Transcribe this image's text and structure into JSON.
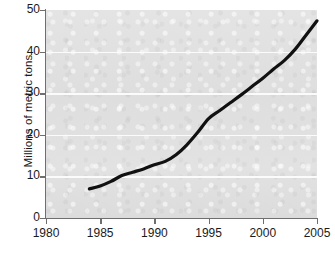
{
  "chart_data": {
    "type": "line",
    "title": "",
    "subtitle": "",
    "xlabel": "",
    "ylabel": "Millions of metric tons",
    "xlim": [
      1980,
      2005
    ],
    "ylim": [
      0,
      50
    ],
    "xticks": [
      1980,
      1985,
      1990,
      1995,
      2000,
      2005
    ],
    "xtick_labels": [
      "1980",
      "1985",
      "1990",
      "1995",
      "2000",
      "2005"
    ],
    "yticks": [
      0,
      10,
      20,
      30,
      40,
      50
    ],
    "ytick_labels": [
      "0",
      "10",
      "20",
      "30",
      "40",
      "50"
    ],
    "grid": "horizontal",
    "gridlines_at": [
      10,
      20,
      30,
      40
    ],
    "legend": "none",
    "series": [
      {
        "name": "Millions of metric tons",
        "color": "#111111",
        "line_width": 3.2,
        "x": [
          1984,
          1985,
          1986,
          1987,
          1988,
          1989,
          1990,
          1991,
          1992,
          1993,
          1994,
          1995,
          1996,
          1997,
          1998,
          1999,
          2000,
          2001,
          2002,
          2003,
          2004,
          2005
        ],
        "values": [
          7.0,
          7.7,
          8.8,
          10.2,
          11.0,
          11.8,
          12.8,
          13.6,
          15.2,
          17.6,
          20.6,
          23.9,
          25.8,
          27.7,
          29.6,
          31.6,
          33.6,
          35.8,
          37.9,
          40.6,
          44.0,
          47.4
        ]
      }
    ],
    "annotations": []
  },
  "axes": {
    "y_title": "Millions of metric tons"
  },
  "caption": {
    "text": ""
  },
  "colors": {
    "plot_background": "#e0e0e0",
    "gridline": "#fbfbfb",
    "axis": "#6f6f6f",
    "series": "#111111",
    "text": "#1a1a1a",
    "page_background": "#ffffff"
  }
}
